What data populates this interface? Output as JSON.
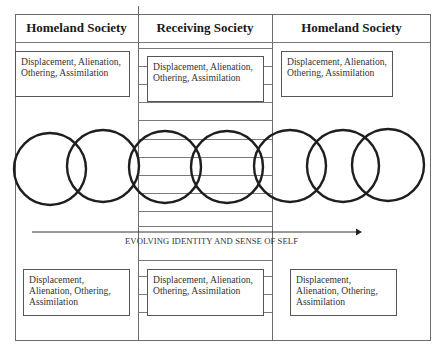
{
  "diagram": {
    "columns": [
      {
        "header": "Homeland Society"
      },
      {
        "header": "Receiving Society"
      },
      {
        "header": "Homeland Society"
      }
    ],
    "top_boxes": [
      {
        "text": "Displacement, Alienation, Othering, Assimilation"
      },
      {
        "text": "Displacement, Alienation, Othering, Assimilation"
      },
      {
        "text": "Displacement, Alienation, Othering, Assimilation"
      }
    ],
    "bottom_boxes": [
      {
        "text": "Displacement, Alienation, Othering, Assimilation"
      },
      {
        "text": "Displacement, Alienation, Othering, Assimilation"
      },
      {
        "text": "Displacement, Alienation, Othering, Assimilation"
      }
    ],
    "circles_count": 7,
    "arrow_label": "EVOLVING IDENTITY AND SENSE OF SELF",
    "colors": {
      "line": "#6b6b6b",
      "circle_stroke": "#1e1e1e",
      "text": "#333333"
    }
  }
}
